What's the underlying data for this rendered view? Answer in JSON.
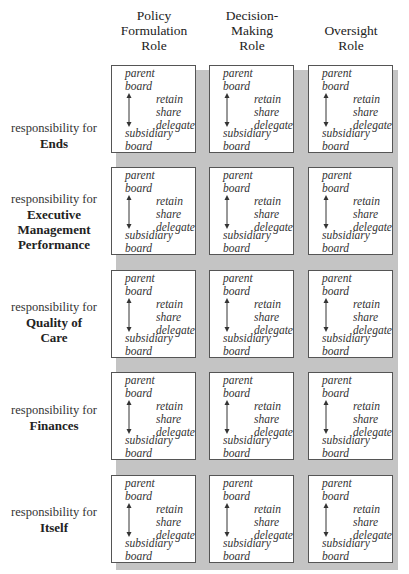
{
  "columns": [
    {
      "label": "Policy Formulation Role",
      "lines": [
        "Policy",
        "Formulation",
        "Role"
      ]
    },
    {
      "label": "Decision-Making Role",
      "lines": [
        "Decision-",
        "Making",
        "Role"
      ]
    },
    {
      "label": "Oversight Role",
      "lines": [
        "",
        "Oversight",
        "Role"
      ]
    }
  ],
  "rows": [
    {
      "prefix": "responsibility for",
      "lines": [
        "Ends"
      ]
    },
    {
      "prefix": "responsibility for",
      "lines": [
        "Executive",
        "Management",
        "Performance"
      ]
    },
    {
      "prefix": "responsibility for",
      "lines": [
        "Quality of",
        "Care"
      ]
    },
    {
      "prefix": "responsibility for",
      "lines": [
        "Finances"
      ]
    },
    {
      "prefix": "responsibility for",
      "lines": [
        "Itself"
      ]
    }
  ],
  "cell": {
    "top_lines": [
      "parent",
      "board"
    ],
    "bottom_lines": [
      "subsidiary",
      "board"
    ],
    "options": [
      "retain",
      "share",
      "delegate"
    ],
    "arrow_icon": "double-headed-vertical-arrow"
  },
  "colors": {
    "shadow": "#c4c4c4",
    "border": "#555555",
    "text": "#333333"
  }
}
